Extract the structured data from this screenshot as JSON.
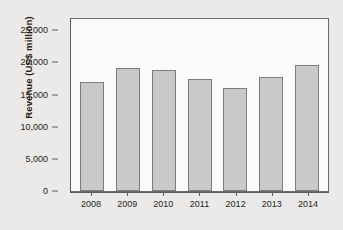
{
  "chart_data": {
    "type": "bar",
    "title": "",
    "xlabel": "",
    "ylabel": "Revenue (US$ million)",
    "categories": [
      "2008",
      "2009",
      "2010",
      "2011",
      "2012",
      "2013",
      "2014"
    ],
    "values": [
      17400,
      19700,
      19400,
      17900,
      16400,
      18200,
      20200
    ],
    "ylim": [
      0,
      27500
    ],
    "yticks": [
      0,
      5000,
      10000,
      15000,
      20000,
      25000
    ],
    "ytick_labels": [
      "0",
      "5,000",
      "10,000",
      "15,000",
      "20,000",
      "25,000"
    ],
    "grid": false,
    "legend": null,
    "series": [
      {
        "name": "Revenue",
        "values": [
          17400,
          19700,
          19400,
          17900,
          16400,
          18200,
          20200
        ]
      }
    ],
    "colors": {
      "bar_fill": "#c9c9c7",
      "bar_edge": "#7d7d7d",
      "plot_background": "#fbfbfa",
      "figure_background": "#eceae8",
      "axis": "#5a5a5a",
      "text": "#231f20"
    }
  }
}
